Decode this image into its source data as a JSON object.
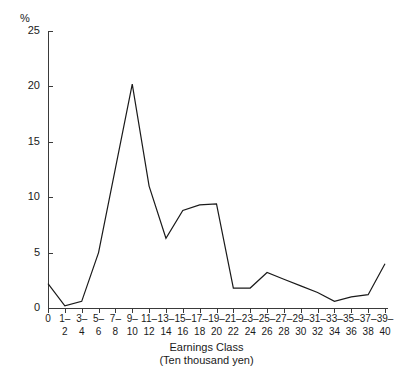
{
  "chart_data": {
    "type": "line",
    "title": "",
    "xlabel": "Earnings Class",
    "xlabel_sub": "(Ten thousand yen)",
    "ylabel": "%",
    "ylim": [
      0,
      25
    ],
    "yticks": [
      0,
      5,
      10,
      15,
      20,
      25
    ],
    "ytick_labels": [
      "0",
      "5",
      "10",
      "15",
      "20",
      "25"
    ],
    "grid": false,
    "legend": null,
    "categories": [
      "0",
      "1–2",
      "3–4",
      "5–6",
      "7–8",
      "9–10",
      "11–12",
      "13–14",
      "15–16",
      "17–18",
      "19–20",
      "21–22",
      "23–24",
      "25–26",
      "27–28",
      "29–30",
      "31–32",
      "33–34",
      "35–36",
      "37–38",
      "39–40"
    ],
    "category_upper": [
      "0",
      "1–",
      "3–",
      "5–",
      "7–",
      "9–",
      "11–",
      "13–",
      "15–",
      "17–",
      "19–",
      "21–",
      "23–",
      "25–",
      "27–",
      "29–",
      "31–",
      "33–",
      "35–",
      "37–",
      "39–"
    ],
    "category_lower": [
      "",
      "2",
      "4",
      "6",
      "8",
      "10",
      "12",
      "14",
      "16",
      "18",
      "20",
      "22",
      "24",
      "26",
      "28",
      "30",
      "32",
      "34",
      "36",
      "38",
      "40"
    ],
    "values": [
      2.2,
      0.2,
      0.6,
      5.0,
      12.6,
      20.2,
      11.0,
      6.3,
      8.8,
      9.3,
      9.4,
      1.8,
      1.8,
      3.2,
      2.6,
      2.0,
      1.4,
      0.6,
      1.0,
      1.2,
      4.0
    ],
    "series": [
      {
        "name": "Distribution",
        "color": "#1a1a1a",
        "values": [
          2.2,
          0.2,
          0.6,
          5.0,
          12.6,
          20.2,
          11.0,
          6.3,
          8.8,
          9.3,
          9.4,
          1.8,
          1.8,
          3.2,
          2.6,
          2.0,
          1.4,
          0.6,
          1.0,
          1.2,
          4.0
        ]
      }
    ]
  },
  "axes": {
    "y_unit": "%",
    "y_labels": [
      "25",
      "20",
      "15",
      "10",
      "5",
      "0"
    ],
    "x_title": "Earnings Class",
    "x_subtitle": "(Ten thousand yen)"
  },
  "colors": {
    "line": "#1a1a1a",
    "axis": "#3a3a3a",
    "background": "#ffffff"
  }
}
